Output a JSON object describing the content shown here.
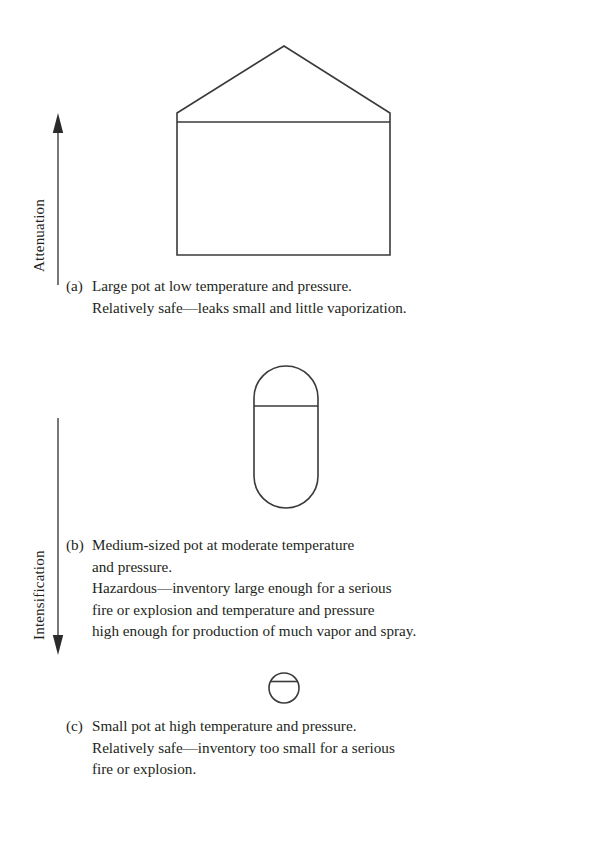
{
  "figure": {
    "axes": [
      {
        "name": "attenuation",
        "label": "Attenuation",
        "direction": "up"
      },
      {
        "name": "intensification",
        "label": "Intensification",
        "direction": "down"
      }
    ],
    "items": [
      {
        "tag": "(a)",
        "vessel": "large-cone-roof-tank",
        "lines": [
          "Large pot at low temperature and pressure.",
          "Relatively safe—leaks small and little vaporization."
        ]
      },
      {
        "tag": "(b)",
        "vessel": "medium-capsule-vessel",
        "lines": [
          "Medium-sized pot at moderate temperature",
          "and pressure.",
          "Hazardous—inventory large enough for a serious",
          "fire or explosion and temperature and pressure",
          "high enough for production of much vapor and spray."
        ]
      },
      {
        "tag": "(c)",
        "vessel": "small-spherical-vessel",
        "lines": [
          "Small pot at high temperature and pressure.",
          "Relatively safe—inventory too small for a serious",
          "fire or explosion."
        ]
      }
    ],
    "colors": {
      "ink": "#231f20",
      "stroke": "#3a3a3c",
      "background": "#ffffff"
    }
  }
}
